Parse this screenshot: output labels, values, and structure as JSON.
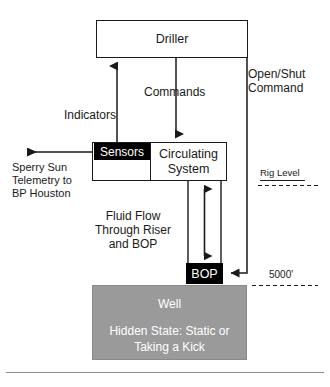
{
  "diagram": {
    "nodes": {
      "driller": "Driller",
      "sensors": "Sensors",
      "circulating_system": "Circulating\nSystem",
      "bop": "BOP",
      "well_title": "Well",
      "well_hidden_state": "Hidden State:\nStatic or  Taking a Kick"
    },
    "edge_labels": {
      "indicators": "Indicators",
      "commands": "Commands",
      "open_shut_command": "Open/Shut\nCommand",
      "telemetry": "Sperry Sun\nTelemetry to\nBP Houston",
      "fluid_flow": "Fluid Flow\nThrough Riser\nand BOP"
    },
    "annotations": {
      "rig_level": "Rig Level",
      "depth": "5000'"
    },
    "colors": {
      "line": "#1a1a1a",
      "filled_node_bg": "#000000",
      "filled_node_text": "#ffffff",
      "well_bg": "#9a9a9a",
      "well_text": "#ffffff",
      "page_bg": "#ffffff"
    }
  }
}
